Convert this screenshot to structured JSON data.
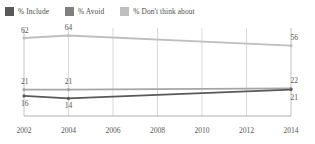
{
  "legend": {
    "position": "top-left",
    "items": [
      {
        "label": "% Include",
        "color": "#595959",
        "icon": "square-swatch"
      },
      {
        "label": "% Avoid",
        "color": "#7f7f7f",
        "icon": "square-swatch"
      },
      {
        "label": "% Don't think about",
        "color": "#bfbfbf",
        "icon": "square-swatch"
      }
    ]
  },
  "chart_data": {
    "type": "line",
    "title": "",
    "subtitle": "",
    "xlabel": "",
    "ylabel": "",
    "x": [
      2002,
      2004,
      2014
    ],
    "xticks": [
      "2002",
      "2004",
      "2006",
      "2008",
      "2010",
      "2012",
      "2014"
    ],
    "xlim": [
      2002,
      2014
    ],
    "ylim": [
      0,
      70
    ],
    "grid": "vertical",
    "legend_position": "top-left",
    "series": [
      {
        "name": "% Don't think about",
        "color": "#bfbfbf",
        "values": [
          62,
          64,
          56
        ],
        "labels": [
          "62",
          "64",
          "56"
        ],
        "label_positions": [
          "above",
          "above",
          "above"
        ]
      },
      {
        "name": "% Avoid",
        "color": "#a6a6a6",
        "values": [
          21,
          21,
          22
        ],
        "labels": [
          "21",
          "21",
          "22"
        ],
        "label_positions": [
          "above",
          "above",
          "above"
        ]
      },
      {
        "name": "% Include",
        "color": "#595959",
        "values": [
          16,
          14,
          21
        ],
        "labels": [
          "16",
          "14",
          "21"
        ],
        "label_positions": [
          "below",
          "below",
          "below"
        ]
      }
    ]
  }
}
